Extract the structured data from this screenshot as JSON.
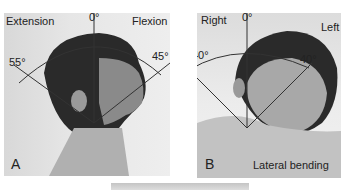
{
  "figure": {
    "panels": [
      {
        "id": "A",
        "panel_label": "A",
        "left_label": "Extension",
        "right_label": "Flexion",
        "zero_label": "0°",
        "left_angle": "55°",
        "right_angle": "45°"
      },
      {
        "id": "B",
        "panel_label": "B",
        "left_label": "Right",
        "right_label": "Left",
        "zero_label": "0°",
        "left_angle": "40°",
        "right_angle": "40°",
        "caption": "Lateral bending"
      }
    ]
  }
}
